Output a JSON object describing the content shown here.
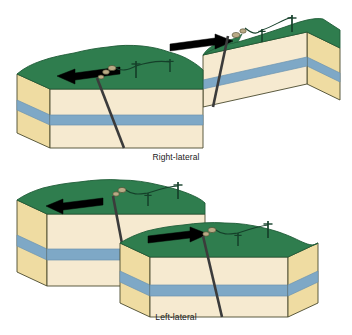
{
  "figure": {
    "background_color": "#ffffff"
  },
  "captions": {
    "top": "Right-lateral",
    "bottom": "Left-lateral"
  },
  "palette": {
    "grass_green": "#2f7d4e",
    "grass_green_dark": "#1f5c38",
    "sandstone_top": "#f2e3b0",
    "sandstone_side": "#efdca2",
    "sandstone_face": "#f6ead0",
    "marker_bed_blue": "#7ea8c6",
    "marker_bed_blue_dark": "#6b93b0",
    "outline": "#4a4a2e",
    "fault_line": "#3b3b3b",
    "arrow_black": "#000000",
    "pole_color": "#15402a"
  },
  "diagrams": [
    {
      "name": "right-lateral",
      "caption": "Right-lateral",
      "arrows": [
        {
          "name": "arrow-left",
          "direction": "left",
          "block": "near-left-block"
        },
        {
          "name": "arrow-right",
          "direction": "right",
          "block": "far-right-block"
        }
      ],
      "layers": [
        "grass",
        "sandstone-upper",
        "marker-bed",
        "sandstone-lower"
      ],
      "features": [
        "fault-trace",
        "offset-power-line",
        "utility-poles"
      ]
    },
    {
      "name": "left-lateral",
      "caption": "Left-lateral",
      "arrows": [
        {
          "name": "arrow-left",
          "direction": "left",
          "block": "far-left-block"
        },
        {
          "name": "arrow-right",
          "direction": "right",
          "block": "near-right-block"
        }
      ],
      "layers": [
        "grass",
        "sandstone-upper",
        "marker-bed",
        "sandstone-lower"
      ],
      "features": [
        "fault-trace",
        "offset-power-line",
        "utility-poles"
      ]
    }
  ]
}
